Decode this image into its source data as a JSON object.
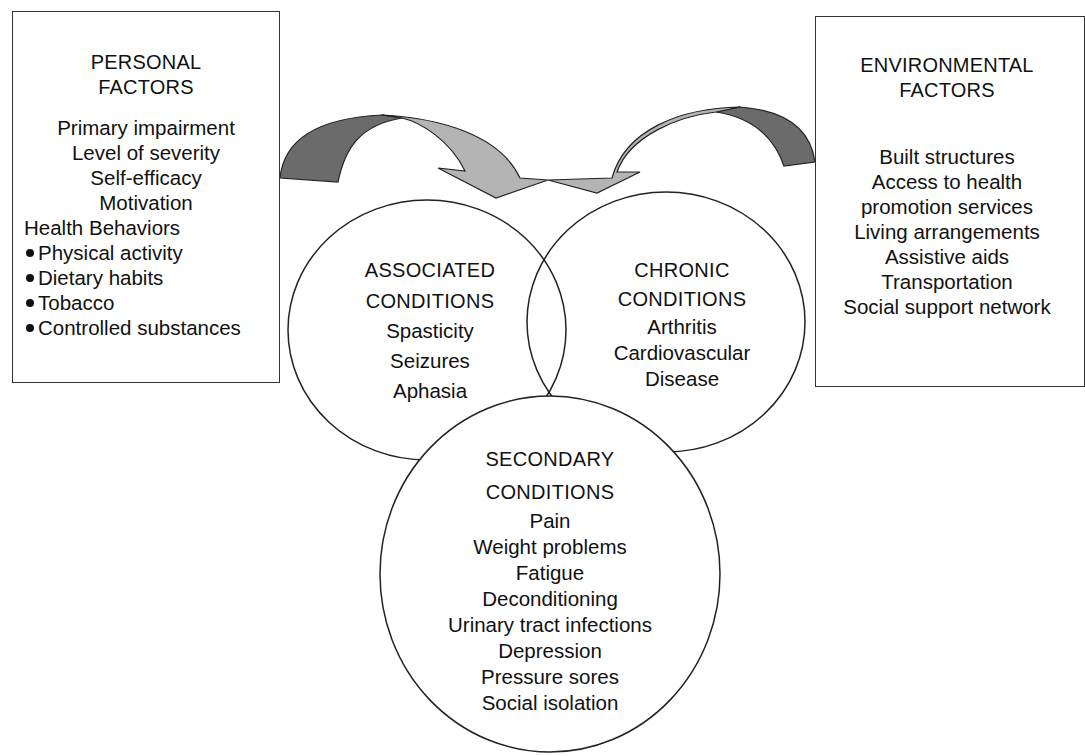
{
  "personal_factors": {
    "title_line1": "PERSONAL",
    "title_line2": "FACTORS",
    "items": [
      "Primary impairment",
      "Level of severity",
      "Self-efficacy",
      "Motivation"
    ],
    "health_behaviors_label": "Health Behaviors",
    "health_behaviors": [
      "Physical activity",
      "Dietary habits",
      "Tobacco",
      "Controlled substances"
    ]
  },
  "environmental_factors": {
    "title_line1": "ENVIRONMENTAL",
    "title_line2": "FACTORS",
    "items": [
      "Built structures",
      "Access to health",
      "promotion services",
      "Living arrangements",
      "Assistive aids",
      "Transportation",
      "Social support network"
    ]
  },
  "associated_conditions": {
    "title_line1": "ASSOCIATED",
    "title_line2": "CONDITIONS",
    "items": [
      "Spasticity",
      "Seizures",
      "Aphasia"
    ]
  },
  "chronic_conditions": {
    "title_line1": "CHRONIC",
    "title_line2": "CONDITIONS",
    "items": [
      "Arthritis",
      "Cardiovascular",
      "Disease"
    ]
  },
  "secondary_conditions": {
    "title_line1": "SECONDARY",
    "title_line2": "CONDITIONS",
    "items": [
      "Pain",
      "Weight problems",
      "Fatigue",
      "Deconditioning",
      "Urinary tract infections",
      "Depression",
      "Pressure sores",
      "Social isolation"
    ]
  },
  "colors": {
    "arrow_dark": "#6b6b6b",
    "arrow_light": "#b4b4b4",
    "stroke": "#222222"
  }
}
